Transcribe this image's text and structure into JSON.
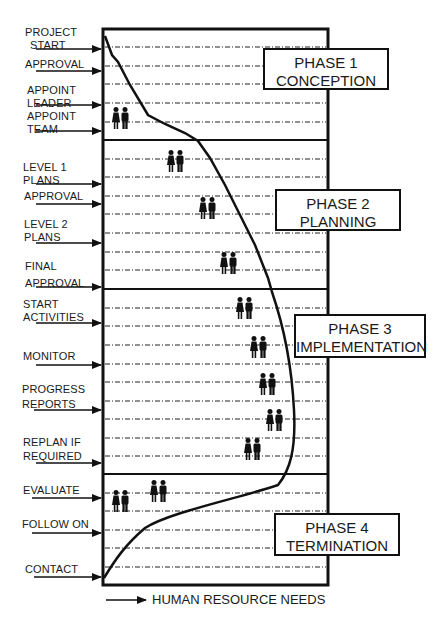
{
  "diagram": {
    "x_axis_label": "HUMAN RESOURCE NEEDS",
    "milestones": [
      {
        "label_lines": [
          "PROJECT",
          "START"
        ],
        "y": 46
      },
      {
        "label_lines": [
          "APPROVAL"
        ],
        "y": 71
      },
      {
        "label_lines": [
          "APPOINT",
          "LEADER"
        ],
        "y": 105
      },
      {
        "label_lines": [
          "APPOINT",
          "TEAM"
        ],
        "y": 131
      },
      {
        "label_lines": [
          "LEVEL 1",
          "PLANS"
        ],
        "y": 184
      },
      {
        "label_lines": [
          "APPROVAL"
        ],
        "y": 204
      },
      {
        "label_lines": [
          "LEVEL 2",
          "PLANS"
        ],
        "y": 243
      },
      {
        "label_lines": [
          "FINAL",
          "APPROVAL"
        ],
        "y": 287
      },
      {
        "label_lines": [
          "START",
          "ACTIVITIES"
        ],
        "y": 323
      },
      {
        "label_lines": [
          "MONITOR"
        ],
        "y": 365
      },
      {
        "label_lines": [
          "PROGRESS",
          "REPORTS"
        ],
        "y": 410
      },
      {
        "label_lines": [
          "REPLAN  IF",
          "REQUIRED"
        ],
        "y": 463
      },
      {
        "label_lines": [
          "EVALUATE"
        ],
        "y": 498
      },
      {
        "label_lines": [
          "FOLLOW ON"
        ],
        "y": 533
      },
      {
        "label_lines": [
          "CONTACT"
        ],
        "y": 577
      }
    ],
    "phases": [
      {
        "title": "PHASE 1",
        "name": "CONCEPTION"
      },
      {
        "title": "PHASE 2",
        "name": "PLANNING"
      },
      {
        "title": "PHASE 3",
        "name": "IMPLEMENTATION"
      },
      {
        "title": "PHASE 4",
        "name": "TERMINATION"
      }
    ],
    "colors": {
      "ink": "#111111",
      "background": "#ffffff"
    }
  }
}
